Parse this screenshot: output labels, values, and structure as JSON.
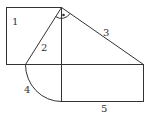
{
  "diagram": {
    "stroke_color": "#333333",
    "labels": {
      "l1": "1",
      "l2": "2",
      "l3": "3",
      "l4": "4",
      "l5": "5"
    },
    "right_angle_marker": "•"
  }
}
